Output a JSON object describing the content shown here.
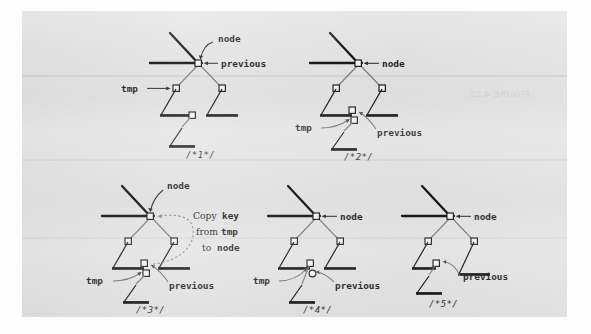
{
  "figure": {
    "kind": "textbook-figure-scan",
    "ghost_text": "FIGURE 4.22",
    "paper_color": "#e3e3e3",
    "ink_color": "#111111",
    "edge_color": "#7b7b7b"
  },
  "labels": {
    "node": "node",
    "previous": "previous",
    "tmp": "tmp",
    "copy_line1": "Copy",
    "copy_key": "key",
    "copy_line2": "from",
    "copy_tmp": "tmp",
    "copy_line3": "to",
    "copy_node": "node"
  },
  "panels": [
    {
      "id": "panel-1",
      "caption": "/*1*/",
      "pointers": [
        "node",
        "previous",
        "tmp"
      ]
    },
    {
      "id": "panel-2",
      "caption": "/*2*/",
      "pointers": [
        "node",
        "tmp",
        "previous"
      ]
    },
    {
      "id": "panel-3",
      "caption": "/*3*/",
      "pointers": [
        "node",
        "tmp",
        "previous"
      ],
      "annotation": "Copy key from tmp to node"
    },
    {
      "id": "panel-4",
      "caption": "/*4*/",
      "pointers": [
        "node",
        "tmp",
        "previous"
      ]
    },
    {
      "id": "panel-5",
      "caption": "/*5*/",
      "pointers": [
        "node",
        "previous"
      ]
    }
  ]
}
